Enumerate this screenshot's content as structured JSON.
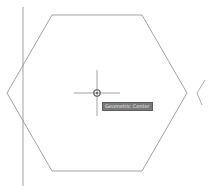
{
  "viewport": {
    "background": "#ffffff",
    "line_color": "#8a8a8a"
  },
  "drawing": {
    "hexagon": {
      "points": "52,15 142,15 187,93 142,171 52,171 7,93"
    },
    "vertical_line": {
      "x": 23,
      "y1": 7,
      "y2": 186
    },
    "partial_shape": {
      "points": "205,80 197,93 202,105"
    }
  },
  "cursor": {
    "center_x": 97,
    "center_y": 93,
    "h_from": 74,
    "h_to": 120,
    "v_from": 70,
    "v_to": 116
  },
  "snap_tooltip": {
    "label": "Geometric Center"
  }
}
